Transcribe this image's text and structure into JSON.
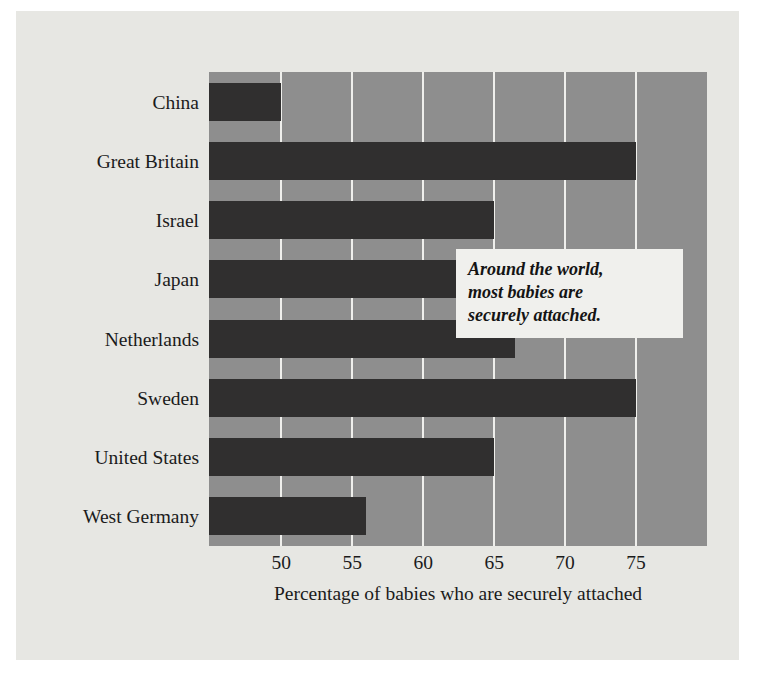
{
  "chart_data": {
    "type": "bar",
    "orientation": "horizontal",
    "title": "",
    "subtitle": "",
    "xlabel": "Percentage of babies who are securely attached",
    "ylabel": "",
    "categories": [
      "China",
      "Great Britain",
      "Israel",
      "Japan",
      "Netherlands",
      "Sweden",
      "United States",
      "West Germany"
    ],
    "values": [
      50,
      75,
      65,
      67,
      66.5,
      75,
      65,
      56
    ],
    "series": [
      {
        "name": "Percentage securely attached",
        "values": [
          50,
          75,
          65,
          67,
          66.5,
          75,
          65,
          56
        ]
      }
    ],
    "xticks": [
      50,
      55,
      60,
      65,
      70,
      75
    ],
    "xtick_labels": [
      "50",
      "55",
      "60",
      "65",
      "70",
      "75"
    ],
    "xlim": [
      44.9,
      80.0
    ],
    "grid": true,
    "grid_axis": "x",
    "grid_color": "#efefec",
    "legend": false,
    "legend_position": "none",
    "annotations": [
      {
        "text": "Around the world, most babies are securely attached.",
        "lines": [
          "Around the world,",
          "most babies are",
          "securely attached."
        ],
        "style": "bold-italic"
      }
    ]
  },
  "colors": {
    "page_background": "#ffffff",
    "card_background": "#e7e7e3",
    "plot_background": "#8e8e8e",
    "bar_color": "#302f2f",
    "gridline_color": "#efefec",
    "text_color": "#1b1b1b",
    "annotation_background": "#f0f0ed",
    "annotation_text": "#141414"
  }
}
